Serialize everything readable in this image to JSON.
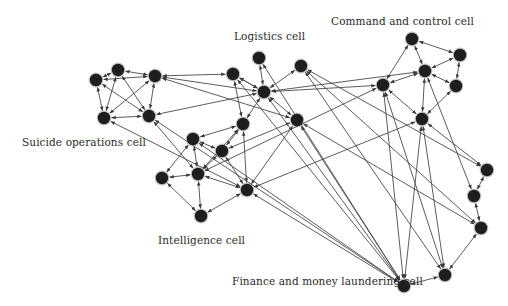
{
  "diagram": {
    "title": "",
    "labels": [
      {
        "id": "logistics",
        "text": "Logistics cell",
        "x": 234,
        "y": 36
      },
      {
        "id": "command",
        "text": "Command and control cell",
        "x": 331,
        "y": 15
      },
      {
        "id": "suicide",
        "text": "Suicide operations cell",
        "x": 22,
        "y": 136
      },
      {
        "id": "intelligence",
        "text": "Intelligence cell",
        "x": 158,
        "y": 234
      },
      {
        "id": "finance",
        "text": "Finance and money laundering cell",
        "x": 232,
        "y": 275
      }
    ],
    "nodes": [
      {
        "id": "s1",
        "group": "suicide",
        "x": 96,
        "y": 80
      },
      {
        "id": "s2",
        "group": "suicide",
        "x": 118,
        "y": 70
      },
      {
        "id": "s3",
        "group": "suicide",
        "x": 155,
        "y": 76
      },
      {
        "id": "s4",
        "group": "suicide",
        "x": 104,
        "y": 118
      },
      {
        "id": "s5",
        "group": "suicide",
        "x": 149,
        "y": 116
      },
      {
        "id": "l1",
        "group": "logistics",
        "x": 233,
        "y": 74
      },
      {
        "id": "l2",
        "group": "logistics",
        "x": 259,
        "y": 58
      },
      {
        "id": "l3",
        "group": "logistics",
        "x": 264,
        "y": 92
      },
      {
        "id": "l4",
        "group": "logistics",
        "x": 301,
        "y": 66
      },
      {
        "id": "l5",
        "group": "logistics",
        "x": 243,
        "y": 124
      },
      {
        "id": "m1",
        "group": "logistics",
        "x": 297,
        "y": 120
      },
      {
        "id": "i1",
        "group": "intelligence",
        "x": 193,
        "y": 139
      },
      {
        "id": "i2",
        "group": "intelligence",
        "x": 222,
        "y": 151
      },
      {
        "id": "i3",
        "group": "intelligence",
        "x": 162,
        "y": 178
      },
      {
        "id": "i4",
        "group": "intelligence",
        "x": 198,
        "y": 174
      },
      {
        "id": "i5",
        "group": "intelligence",
        "x": 247,
        "y": 190
      },
      {
        "id": "i6",
        "group": "intelligence",
        "x": 201,
        "y": 216
      },
      {
        "id": "c1",
        "group": "command",
        "x": 412,
        "y": 39
      },
      {
        "id": "c2",
        "group": "command",
        "x": 460,
        "y": 55
      },
      {
        "id": "c3",
        "group": "command",
        "x": 425,
        "y": 71
      },
      {
        "id": "c4",
        "group": "command",
        "x": 456,
        "y": 86
      },
      {
        "id": "c5",
        "group": "command",
        "x": 383,
        "y": 85
      },
      {
        "id": "c6",
        "group": "command",
        "x": 422,
        "y": 119
      },
      {
        "id": "r1",
        "group": "finance",
        "x": 487,
        "y": 170
      },
      {
        "id": "r2",
        "group": "finance",
        "x": 474,
        "y": 196
      },
      {
        "id": "r3",
        "group": "finance",
        "x": 481,
        "y": 228
      },
      {
        "id": "f1",
        "group": "finance",
        "x": 445,
        "y": 275
      },
      {
        "id": "f2",
        "group": "finance",
        "x": 404,
        "y": 286
      }
    ],
    "edges": [
      [
        "s1",
        "s2"
      ],
      [
        "s2",
        "s3"
      ],
      [
        "s1",
        "s3"
      ],
      [
        "s1",
        "s4"
      ],
      [
        "s1",
        "s5"
      ],
      [
        "s2",
        "s4"
      ],
      [
        "s2",
        "s5"
      ],
      [
        "s3",
        "s4"
      ],
      [
        "s3",
        "s5"
      ],
      [
        "s4",
        "s5"
      ],
      [
        "s3",
        "l1"
      ],
      [
        "s3",
        "m1"
      ],
      [
        "s5",
        "l3"
      ],
      [
        "s4",
        "i5"
      ],
      [
        "s5",
        "i4"
      ],
      [
        "l2",
        "l3"
      ],
      [
        "l1",
        "l3"
      ],
      [
        "l3",
        "l4"
      ],
      [
        "l3",
        "m1"
      ],
      [
        "l3",
        "c3"
      ],
      [
        "l3",
        "l5"
      ],
      [
        "l1",
        "l5"
      ],
      [
        "l5",
        "i1"
      ],
      [
        "l1",
        "l3"
      ],
      [
        "l5",
        "i4"
      ],
      [
        "l5",
        "i2"
      ],
      [
        "l3",
        "s3"
      ],
      [
        "i1",
        "i2"
      ],
      [
        "i1",
        "i3"
      ],
      [
        "i1",
        "i4"
      ],
      [
        "i2",
        "i4"
      ],
      [
        "i2",
        "i5"
      ],
      [
        "i3",
        "i4"
      ],
      [
        "i3",
        "i6"
      ],
      [
        "i4",
        "i6"
      ],
      [
        "i6",
        "i5"
      ],
      [
        "i4",
        "i5"
      ],
      [
        "i5",
        "l5"
      ],
      [
        "m1",
        "i2"
      ],
      [
        "c5",
        "i4"
      ],
      [
        "c6",
        "i5"
      ],
      [
        "m1",
        "i5"
      ],
      [
        "c1",
        "c2"
      ],
      [
        "c1",
        "c3"
      ],
      [
        "c1",
        "c5"
      ],
      [
        "c2",
        "c3"
      ],
      [
        "c2",
        "c4"
      ],
      [
        "c3",
        "c4"
      ],
      [
        "c3",
        "c5"
      ],
      [
        "c3",
        "c6"
      ],
      [
        "c4",
        "c6"
      ],
      [
        "c5",
        "c6"
      ],
      [
        "c5",
        "l3"
      ],
      [
        "c3",
        "r2"
      ],
      [
        "c6",
        "r1"
      ],
      [
        "l4",
        "r1"
      ],
      [
        "l4",
        "r3"
      ],
      [
        "l2",
        "f2"
      ],
      [
        "l3",
        "f2"
      ],
      [
        "m1",
        "f2"
      ],
      [
        "m1",
        "r3"
      ],
      [
        "l1",
        "f2"
      ],
      [
        "l4",
        "f1"
      ],
      [
        "c5",
        "f2"
      ],
      [
        "c6",
        "f2"
      ],
      [
        "c5",
        "f1"
      ],
      [
        "c6",
        "f1"
      ],
      [
        "i5",
        "f2"
      ],
      [
        "i1",
        "f2"
      ],
      [
        "s5",
        "f2"
      ],
      [
        "r1",
        "r2"
      ],
      [
        "r2",
        "r3"
      ],
      [
        "r3",
        "f1"
      ],
      [
        "f1",
        "f2"
      ]
    ],
    "colors": {
      "node": "#1e1e1e",
      "edge": "#4a4a4a",
      "label": "#2a2a2a",
      "background": "#ffffff"
    }
  }
}
